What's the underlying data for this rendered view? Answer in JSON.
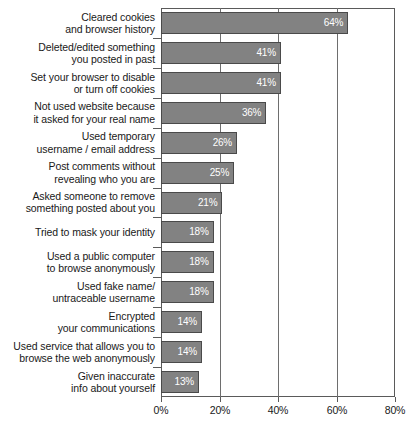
{
  "chart_data": {
    "type": "bar",
    "orientation": "horizontal",
    "title": "",
    "subtitle": "",
    "xlabel": "",
    "ylabel": "",
    "xlim": [
      0,
      80
    ],
    "grid": true,
    "legend": null,
    "categories": [
      "Cleared cookies\nand browser history",
      "Deleted/edited something\nyou posted in past",
      "Set your browser to disable\nor turn off cookies",
      "Not used website because\nit asked for your real name",
      "Used temporary\nusername / email address",
      "Post comments without\nrevealing who you are",
      "Asked someone to remove\nsomething posted about you",
      "Tried to mask your identity",
      "Used a public computer\nto browse anonymously",
      "Used fake name/\nuntraceable username",
      "Encrypted\nyour communications",
      "Used service that allows you to\nbrowse the web anonymously",
      "Given inaccurate\ninfo about yourself"
    ],
    "values": [
      64,
      41,
      41,
      36,
      26,
      25,
      21,
      18,
      18,
      18,
      14,
      14,
      13
    ],
    "value_labels": [
      "64%",
      "41%",
      "41%",
      "36%",
      "26%",
      "25%",
      "21%",
      "18%",
      "18%",
      "18%",
      "14%",
      "14%",
      "13%"
    ],
    "xticks": [
      0,
      20,
      40,
      60,
      80
    ],
    "xtick_labels": [
      "0%",
      "20%",
      "40%",
      "60%",
      "80%"
    ],
    "colors": {
      "bar_fill": "#828282",
      "bar_border": "#4a4a4a",
      "value_label": "#ffffff",
      "axis": "#5a5a5a",
      "gridline": "#6e6e6e",
      "text": "#191919",
      "background": "#ffffff"
    }
  }
}
